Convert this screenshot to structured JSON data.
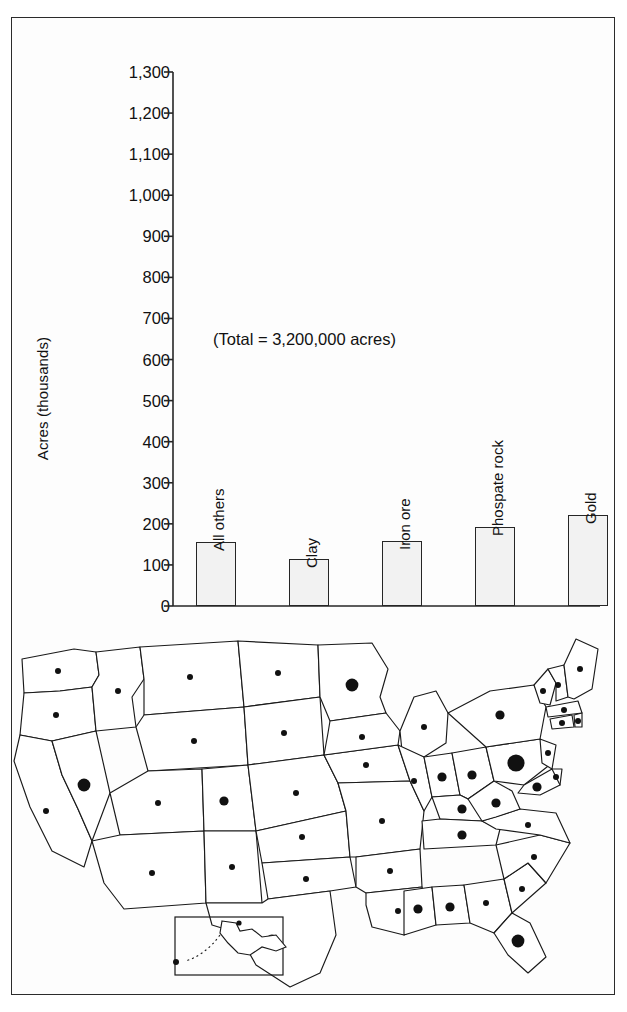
{
  "figure": {
    "frame": {
      "border_color": "#2b2b2b",
      "background": "#fdfdfd"
    }
  },
  "chart_data": {
    "type": "bar",
    "title": "",
    "subtitle": "",
    "xlabel": "",
    "ylabel": "Acres (thousands)",
    "ylim": [
      0,
      1300
    ],
    "grid": false,
    "legend": null,
    "annotations": [
      "(Total = 3,200,000 acres)"
    ],
    "ytick_labels": [
      "1,300",
      "1,200",
      "1,100",
      "1,000",
      "900",
      "800",
      "700",
      "600",
      "500",
      "400",
      "300",
      "200",
      "100",
      "0"
    ],
    "ytick_values": [
      1300,
      1200,
      1100,
      1000,
      900,
      800,
      700,
      600,
      500,
      400,
      300,
      200,
      100,
      0
    ],
    "categories": [
      "All others",
      "Clay",
      "Iron ore",
      "Phospate rock",
      "Gold",
      "Stone",
      "Sand and gravel",
      "Coal"
    ],
    "values": [
      155,
      115,
      158,
      192,
      222,
      258,
      835,
      1295
    ],
    "bar_fill": "#f2f2f2",
    "bar_stroke": "#262626",
    "total_acres": "3,200,000"
  },
  "annotation": {
    "total_label": "(Total = 3,200,000 acres)"
  },
  "axis": {
    "y_title": "Acres (thousands)"
  },
  "map": {
    "title": "",
    "inset_label": "",
    "dot_color": "#111111",
    "outline_color": "#1a1a1a",
    "dots": [
      {
        "state": "WA",
        "size": "small"
      },
      {
        "state": "OR",
        "size": "small"
      },
      {
        "state": "ID",
        "size": "small"
      },
      {
        "state": "MT",
        "size": "small"
      },
      {
        "state": "ND",
        "size": "small"
      },
      {
        "state": "MN",
        "size": "large"
      },
      {
        "state": "WY",
        "size": "small"
      },
      {
        "state": "SD",
        "size": "small"
      },
      {
        "state": "NE",
        "size": "small"
      },
      {
        "state": "IA",
        "size": "small"
      },
      {
        "state": "NV",
        "size": "large"
      },
      {
        "state": "UT",
        "size": "small"
      },
      {
        "state": "CO",
        "size": "medium"
      },
      {
        "state": "KS",
        "size": "small"
      },
      {
        "state": "MO",
        "size": "small"
      },
      {
        "state": "CA",
        "size": "small"
      },
      {
        "state": "AZ",
        "size": "small"
      },
      {
        "state": "NM",
        "size": "small"
      },
      {
        "state": "OK",
        "size": "small"
      },
      {
        "state": "AR",
        "size": "small"
      },
      {
        "state": "TX",
        "size": "large"
      },
      {
        "state": "LA",
        "size": "small"
      },
      {
        "state": "WI",
        "size": "small"
      },
      {
        "state": "MI",
        "size": "small"
      },
      {
        "state": "IL",
        "size": "small"
      },
      {
        "state": "IN",
        "size": "medium"
      },
      {
        "state": "OH",
        "size": "medium"
      },
      {
        "state": "KY",
        "size": "medium"
      },
      {
        "state": "TN",
        "size": "medium"
      },
      {
        "state": "MS",
        "size": "medium"
      },
      {
        "state": "AL",
        "size": "medium"
      },
      {
        "state": "GA",
        "size": "small"
      },
      {
        "state": "FL",
        "size": "large"
      },
      {
        "state": "SC",
        "size": "small"
      },
      {
        "state": "NC",
        "size": "small"
      },
      {
        "state": "VA",
        "size": "small"
      },
      {
        "state": "WV",
        "size": "medium"
      },
      {
        "state": "PA",
        "size": "xlarge"
      },
      {
        "state": "NY",
        "size": "medium"
      },
      {
        "state": "VT",
        "size": "small"
      },
      {
        "state": "NH",
        "size": "small"
      },
      {
        "state": "ME",
        "size": "small"
      },
      {
        "state": "MA",
        "size": "small"
      },
      {
        "state": "CT",
        "size": "small"
      },
      {
        "state": "RI",
        "size": "small"
      },
      {
        "state": "NJ",
        "size": "small"
      },
      {
        "state": "DE",
        "size": "small"
      },
      {
        "state": "MD",
        "size": "medium"
      },
      {
        "state": "AK",
        "size": "small"
      },
      {
        "state": "HI",
        "size": "small"
      }
    ]
  }
}
